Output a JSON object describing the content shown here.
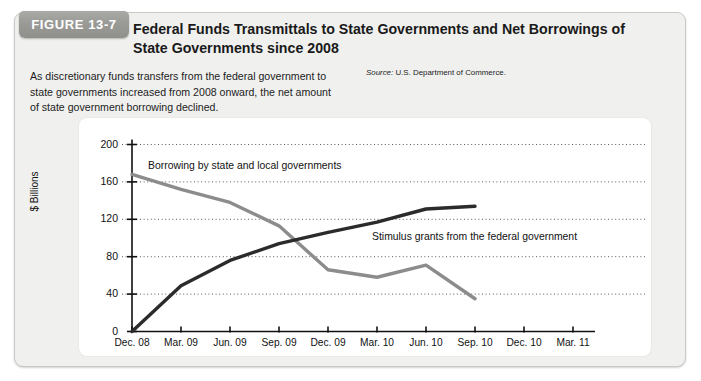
{
  "figure": {
    "badge_label": "FIGURE 13-7",
    "title": "Federal Funds Transmittals to State Governments and Net Borrowings of State Governments since 2008",
    "caption": "As discretionary funds transfers from the federal government to state governments increased from 2008 onward, the net amount of state government borrowing declined.",
    "source_prefix": "Source:",
    "source_text": "U.S. Department of Commerce.",
    "badge_color": "#9a9a97",
    "panel_color": "#f0f0ef"
  },
  "chart_data": {
    "type": "line",
    "title": "Federal Funds Transmittals to State Governments and Net Borrowings of State Governments since 2008",
    "xlabel": "",
    "ylabel": "$ Billions",
    "categories": [
      "Dec. 08",
      "Mar. 09",
      "Jun. 09",
      "Sep. 09",
      "Dec. 09",
      "Mar. 10",
      "Jun. 10",
      "Sep. 10",
      "Dec. 10",
      "Mar. 11"
    ],
    "ylim": [
      0,
      200
    ],
    "yticks": [
      0,
      40,
      80,
      120,
      160,
      200
    ],
    "grid": "horizontal-dotted",
    "legend": "inline-annotations",
    "series": [
      {
        "name": "Borrowing by state and local governments",
        "color": "#8c8c8c",
        "values": [
          168,
          152,
          138,
          113,
          66,
          58,
          71,
          35,
          null,
          null
        ]
      },
      {
        "name": "Stimulus grants from the federal government",
        "color": "#2b2b2b",
        "values": [
          0,
          49,
          76,
          94,
          106,
          117,
          131,
          134,
          null,
          null
        ]
      }
    ],
    "annotations": [
      {
        "text": "Borrowing by state and local governments",
        "series": "Borrowing by state and local governments"
      },
      {
        "text": "Stimulus grants from the federal government",
        "series": "Stimulus grants from the federal government"
      }
    ]
  }
}
